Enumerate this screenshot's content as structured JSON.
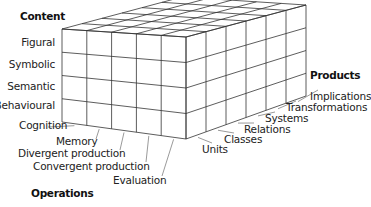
{
  "diagram": {
    "type": "3d-cube-model",
    "axes": {
      "content": {
        "title": "Content",
        "items": [
          "Figural",
          "Symbolic",
          "Semantic",
          "Behavioural"
        ]
      },
      "operations": {
        "title": "Operations",
        "items": [
          "Cognition",
          "Memory",
          "Divergent production",
          "Convergent production",
          "Evaluation"
        ]
      },
      "products": {
        "title": "Products",
        "items": [
          "Units",
          "Classes",
          "Relations",
          "Systems",
          "Transformations",
          "Implications"
        ]
      }
    },
    "colors": {
      "line": "#333333",
      "leader": "#555555",
      "background": "#ffffff"
    }
  }
}
